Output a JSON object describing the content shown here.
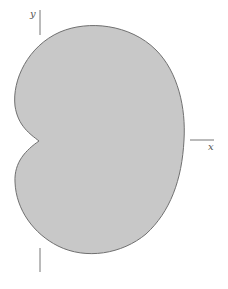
{
  "figure": {
    "shape": "cardioid",
    "colors": {
      "fill": "#c8c8c8",
      "stroke": "#707070",
      "axis": "#777777",
      "background": "#ffffff"
    },
    "axes": {
      "x_label": "x",
      "y_label": "y"
    }
  }
}
